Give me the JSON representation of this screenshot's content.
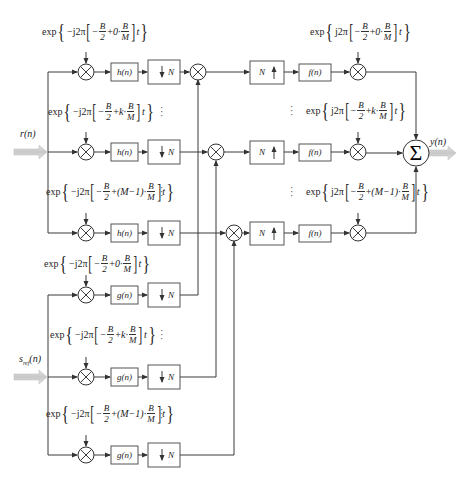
{
  "inputs": {
    "r": "r(n)",
    "s_ref": "s",
    "s_ref_sub": "ref",
    "s_ref_arg": "(n)"
  },
  "output": {
    "y": "y(n)"
  },
  "blocks": {
    "h": "h(n)",
    "g": "g(n)",
    "f": "f(n)",
    "down": "N",
    "up": "N",
    "sum": "Σ"
  },
  "analysis_labels": [
    {
      "prefix": "exp",
      "sign": "−j2π",
      "index": "0·",
      "t": "t",
      "dots": false
    },
    {
      "prefix": "exp",
      "sign": "−j2π",
      "index": "k·",
      "t": "t",
      "dots": true
    },
    {
      "prefix": "exp",
      "sign": "−j2π",
      "index": "(M−1)·",
      "t": "t",
      "dots": true
    },
    {
      "prefix": "exp",
      "sign": "−j2π",
      "index": "0·",
      "t": "t",
      "dots": false
    },
    {
      "prefix": "exp",
      "sign": "−j2π",
      "index": "k·",
      "t": "t",
      "dots": true
    },
    {
      "prefix": "exp",
      "sign": "−j2π",
      "index": "(M−1)·",
      "t": "t",
      "dots": true
    }
  ],
  "synthesis_labels": [
    {
      "prefix": "exp",
      "sign": "j2π",
      "index": "0·",
      "t": "t"
    },
    {
      "prefix": "exp",
      "sign": "j2π",
      "index": "k·",
      "t": "t"
    },
    {
      "prefix": "exp",
      "sign": "j2π",
      "index": "(M−1)·",
      "t": "t"
    }
  ],
  "fraction": {
    "b": "B",
    "two": "2",
    "m": "M",
    "minus": "−",
    "plus": "+"
  }
}
